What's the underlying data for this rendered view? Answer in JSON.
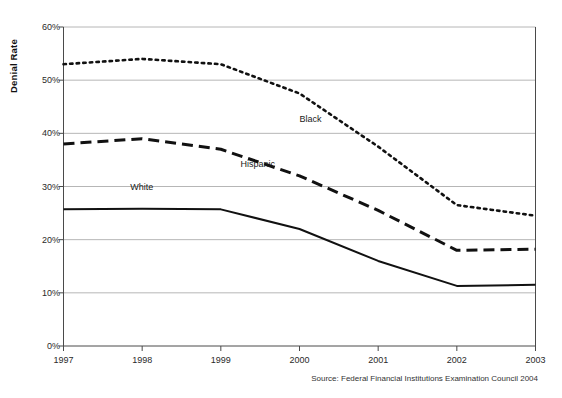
{
  "chart_data": {
    "type": "line",
    "title": "",
    "xlabel": "",
    "ylabel": "Denial Rate",
    "x": [
      1997,
      1998,
      1999,
      2000,
      2001,
      2002,
      2003
    ],
    "xticklabels": [
      "1997",
      "1998",
      "1999",
      "2000",
      "2001",
      "2002",
      "2003"
    ],
    "yticklabels": [
      "0%",
      "10%",
      "20%",
      "30%",
      "40%",
      "50%",
      "60%"
    ],
    "ytickvalues": [
      0,
      10,
      20,
      30,
      40,
      50,
      60
    ],
    "ylim": [
      0,
      60
    ],
    "xlim": [
      1997,
      2003
    ],
    "grid": "horizontal",
    "legend_position": "inline-labels",
    "series": [
      {
        "name": "Black",
        "style": "dotted",
        "color": "#111111",
        "label": "Black",
        "values": [
          53.0,
          54.0,
          53.0,
          47.5,
          37.5,
          26.5,
          24.5
        ]
      },
      {
        "name": "Hispanic",
        "style": "dashed",
        "color": "#111111",
        "label": "Hispanic",
        "values": [
          38.0,
          39.0,
          37.0,
          32.0,
          25.5,
          18.0,
          18.2
        ]
      },
      {
        "name": "White",
        "style": "solid",
        "color": "#111111",
        "label": "White",
        "values": [
          25.7,
          25.8,
          25.7,
          22.0,
          16.0,
          11.3,
          11.5
        ]
      }
    ],
    "annotations": [
      {
        "text": "Black",
        "x": 2000.0,
        "y": 42.5
      },
      {
        "text": "Hispanic",
        "x": 1999.25,
        "y": 34.0
      },
      {
        "text": "White",
        "x": 1997.85,
        "y": 29.8
      }
    ],
    "source": "Source: Federal Financial Institutions Examination Council 2004"
  }
}
